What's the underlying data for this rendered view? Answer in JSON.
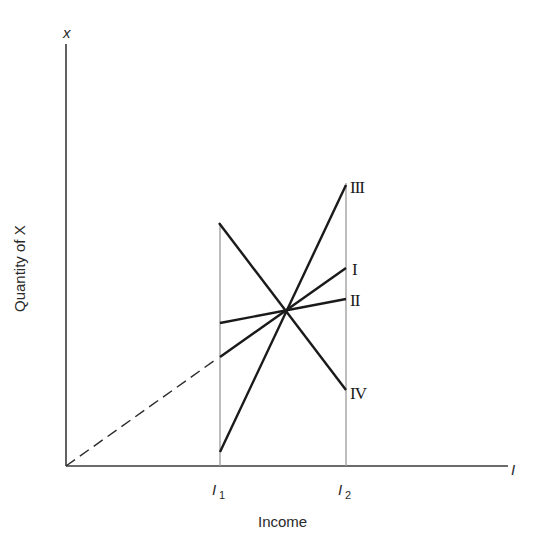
{
  "diagram": {
    "y_axis": {
      "label": "Quantity of X",
      "var": "x"
    },
    "x_axis": {
      "label": "Income",
      "var": "I"
    },
    "ticks": [
      {
        "label": "I",
        "sub": "1",
        "x": 220
      },
      {
        "label": "I",
        "sub": "2",
        "x": 346
      }
    ],
    "lines": [
      {
        "id": "III",
        "label": "III",
        "from": [
          220,
          452
        ],
        "to": [
          346,
          185
        ]
      },
      {
        "id": "I",
        "label": "I",
        "from": [
          220,
          357
        ],
        "to": [
          346,
          268
        ]
      },
      {
        "id": "II",
        "label": "II",
        "from": [
          220,
          323
        ],
        "to": [
          346,
          299
        ]
      },
      {
        "id": "IV",
        "label": "IV",
        "from": [
          219,
          223
        ],
        "to": [
          346,
          390
        ]
      }
    ],
    "dashed_extension": {
      "from": [
        66,
        466
      ],
      "to": [
        220,
        357
      ]
    },
    "intersection": [
      285,
      312
    ],
    "colors": {
      "line": "#1a1a1a",
      "axis": "#3a3a3a",
      "guide": "#9a9a9a"
    }
  }
}
